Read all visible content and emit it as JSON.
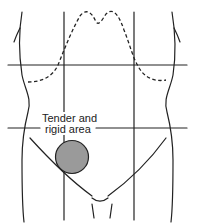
{
  "figure": {
    "type": "abdominal quadrant diagram",
    "annotation": {
      "line1": "Tender and",
      "line2": "rigid area"
    },
    "colors": {
      "stroke": "#222222",
      "tender_area_fill": "#9a9a9a",
      "background": "#ffffff"
    },
    "elements": {
      "body_outline": "torso outline, left and right flanks",
      "ribcage_margin": "dashed costal margin curve",
      "grid": "two vertical and two horizontal lines dividing the abdomen into nine regions",
      "tender_area": "gray circle in right lower quadrant (viewer's left)",
      "inguinal_lines": "lines converging toward pubic region"
    }
  }
}
